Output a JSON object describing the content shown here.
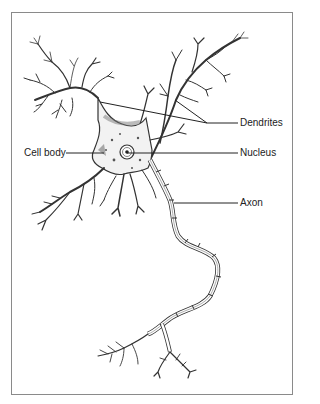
{
  "figure": {
    "labels": {
      "dendrites": "Dendrites",
      "cell_body": "Cell body",
      "nucleus": "Nucleus",
      "axon": "Axon"
    }
  },
  "colors": {
    "frame": "#8a8a8a",
    "ink": "#333333",
    "text": "#222222",
    "background": "#ffffff"
  }
}
